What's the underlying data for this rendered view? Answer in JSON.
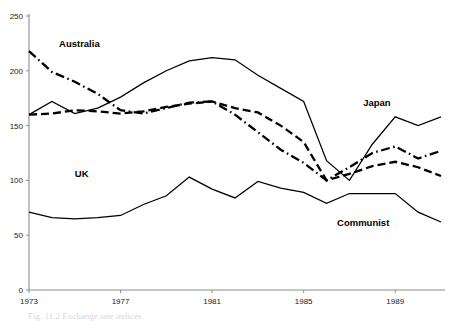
{
  "chart_data": {
    "type": "line",
    "title": "",
    "xlabel": "",
    "ylabel": "",
    "xlim": [
      1973,
      1991
    ],
    "ylim": [
      0,
      250
    ],
    "grid": false,
    "legend": "inline-labels",
    "x_ticks": [
      1973,
      1977,
      1981,
      1985,
      1989
    ],
    "y_ticks": [
      0,
      50,
      100,
      150,
      200,
      250
    ],
    "x": [
      1973,
      1974,
      1975,
      1976,
      1977,
      1978,
      1979,
      1980,
      1981,
      1982,
      1983,
      1984,
      1985,
      1986,
      1987,
      1988,
      1989,
      1990,
      1991
    ],
    "series": [
      {
        "name": "Japan",
        "style": "solid",
        "label": "Japan",
        "label_x": 1988.2,
        "label_y": 168,
        "values": [
          160,
          172,
          161,
          166,
          176,
          189,
          200,
          209,
          212,
          210,
          196,
          184,
          172,
          118,
          100,
          133,
          158,
          150,
          158
        ]
      },
      {
        "name": "Australia",
        "style": "dash-dot",
        "label": "Australia",
        "label_x": 1975.2,
        "label_y": 222,
        "values": [
          218,
          199,
          190,
          179,
          164,
          161,
          166,
          171,
          172,
          160,
          144,
          128,
          116,
          100,
          112,
          125,
          131,
          120,
          127
        ]
      },
      {
        "name": "UK",
        "style": "dashed-thick",
        "label": "UK",
        "label_x": 1975.3,
        "label_y": 103,
        "values": [
          160,
          161,
          164,
          163,
          161,
          163,
          167,
          170,
          172,
          166,
          162,
          150,
          135,
          100,
          106,
          113,
          117,
          112,
          104
        ]
      },
      {
        "name": "Communist",
        "style": "solid",
        "label": "Communist",
        "label_x": 1987.6,
        "label_y": 58,
        "values": [
          71,
          66,
          65,
          66,
          68,
          78,
          86,
          103,
          92,
          84,
          99,
          93,
          89,
          79,
          88,
          88,
          88,
          71,
          62
        ]
      }
    ]
  },
  "caption": {
    "text": "Fig. 11.2   Exchange rate indices"
  }
}
